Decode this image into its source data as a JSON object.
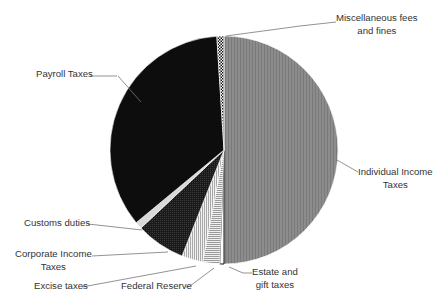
{
  "chart_data": {
    "type": "pie",
    "title": "",
    "start_angle_deg": 0,
    "direction": "clockwise",
    "slices": [
      {
        "label": "Individual Income Taxes",
        "value": 50.0,
        "pattern": "gray-vertical"
      },
      {
        "label": "Estate and gift taxes",
        "value": 0.6,
        "pattern": "black-outline-white"
      },
      {
        "label": "Federal Reserve",
        "value": 2.4,
        "pattern": "horizontal-lines"
      },
      {
        "label": "Excise taxes",
        "value": 3.0,
        "pattern": "vertical-lines"
      },
      {
        "label": "Corporate Income Taxes",
        "value": 7.0,
        "pattern": "dark-dots"
      },
      {
        "label": "Customs duties",
        "value": 1.0,
        "pattern": "light-gray"
      },
      {
        "label": "Payroll Taxes",
        "value": 35.0,
        "pattern": "black"
      },
      {
        "label": "Miscellaneous fees and fines",
        "value": 1.0,
        "pattern": "checker"
      }
    ],
    "legend": "none (leader-line data labels)",
    "grid": false
  },
  "labels": {
    "misc_line1": "Miscellaneous fees",
    "misc_line2": "and fines",
    "payroll": "Payroll Taxes",
    "individual_line1": "Individual Income",
    "individual_line2": "Taxes",
    "customs": "Customs duties",
    "corporate_line1": "Corporate Income",
    "corporate_line2": "Taxes",
    "excise": "Excise taxes",
    "fedreserve": "Federal Reserve",
    "estate_line1": "Estate and",
    "estate_line2": "gift taxes"
  }
}
